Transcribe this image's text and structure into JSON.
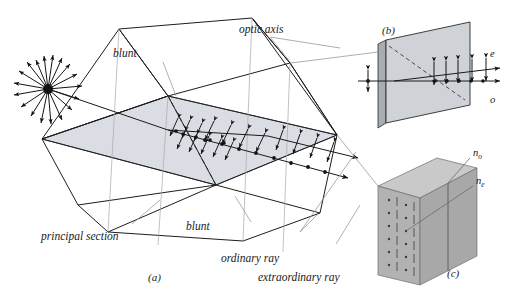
{
  "figure": {
    "colors": {
      "ink": "#1a1a1a",
      "leader": "#8c8c8c",
      "face_fill": "#d9dde3",
      "slab_fill": "#cfd3d7",
      "block_fill": "#b8b8b8",
      "block_fill_dark": "#a2a2a2",
      "block_fill_light": "#c9c9c9",
      "background": "#ffffff"
    }
  },
  "panels": {
    "a": {
      "letter": "(a)"
    },
    "b": {
      "letter": "(b)"
    },
    "c": {
      "letter": "(c)"
    }
  },
  "labels": {
    "optic_axis": "optic axis",
    "blunt_top": "blunt",
    "blunt_bottom": "blunt",
    "principal_section": "principal section",
    "ordinary_ray": "ordinary ray",
    "extraordinary_ray": "extraordinary ray",
    "e_ray": "e",
    "o_ray": "o",
    "n_o_base": "n",
    "n_o_sub": "o",
    "n_e_base": "n",
    "n_e_sub": "e"
  },
  "diagram_data": {
    "type": "optics-schematic",
    "subject": "calcite rhombohedron double refraction",
    "unpolarized_source": {
      "description": "radial double-headed arrows denoting unpolarized incident light",
      "ray_count": 18
    },
    "polarization_markers": {
      "ordinary": "dots (perpendicular to principal section)",
      "extraordinary": "double-headed arrows (in principal section)"
    },
    "refractive_indices": [
      "n_o",
      "n_e"
    ]
  }
}
